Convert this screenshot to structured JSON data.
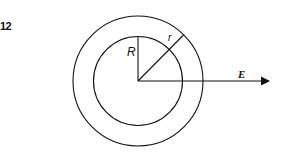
{
  "figure": {
    "number_label": "12",
    "labels": {
      "inner_radius": "R",
      "shell_thickness": "r",
      "field": "E"
    },
    "elements": [
      "outer-circle",
      "inner-circle",
      "inner-radius-line",
      "diagonal-radius-line",
      "field-arrow"
    ],
    "colors": {
      "stroke": "#111111",
      "background": "#ffffff"
    }
  }
}
